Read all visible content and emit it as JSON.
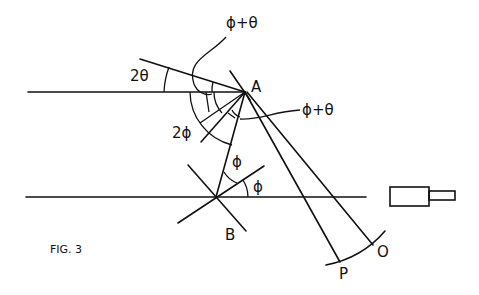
{
  "figure": {
    "caption": "FIG. 3",
    "points": {
      "A": "A",
      "B": "B",
      "P": "P",
      "O": "O"
    },
    "angle_labels": {
      "two_theta": "2θ",
      "phi_plus_theta_top": "ϕ+θ",
      "phi_plus_theta_right": "ϕ+θ",
      "two_phi": "2ϕ",
      "phi_upper": "ϕ",
      "phi_lower": "ϕ"
    },
    "colors": {
      "ink": "#111111",
      "background": "#ffffff"
    }
  }
}
